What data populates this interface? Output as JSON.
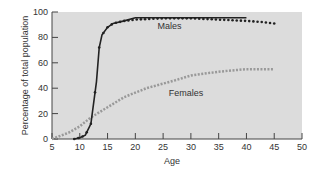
{
  "chart_data": {
    "type": "line",
    "title": "",
    "xlabel": "Age",
    "ylabel": "Percentage of total population",
    "xlim": [
      5,
      50
    ],
    "ylim": [
      0,
      100
    ],
    "xticks": [
      5,
      10,
      15,
      20,
      25,
      30,
      35,
      40,
      45,
      50
    ],
    "yticks": [
      0,
      20,
      40,
      60,
      80,
      100
    ],
    "grid": false,
    "series": [
      {
        "name": "Males",
        "style": "dark dotted with solid fit",
        "color": "#222222",
        "x": [
          9,
          10,
          11,
          12,
          13,
          13.5,
          14,
          15,
          16,
          18,
          20,
          25,
          30,
          35,
          40,
          43,
          45
        ],
        "values": [
          0,
          1,
          3,
          12,
          45,
          72,
          82,
          88,
          91,
          93,
          94,
          95,
          95,
          94,
          93,
          92,
          91
        ]
      },
      {
        "name": "Females",
        "style": "gray dotted",
        "color": "#999999",
        "x": [
          5,
          8,
          10,
          12,
          15,
          18,
          22,
          27,
          30,
          35,
          40,
          45
        ],
        "values": [
          0,
          5,
          10,
          17,
          25,
          33,
          40,
          46,
          50,
          53,
          55,
          55
        ]
      }
    ],
    "annotations": [
      {
        "text": "Males",
        "x": 24,
        "y": 87
      },
      {
        "text": "Females",
        "x": 26,
        "y": 34
      }
    ]
  }
}
